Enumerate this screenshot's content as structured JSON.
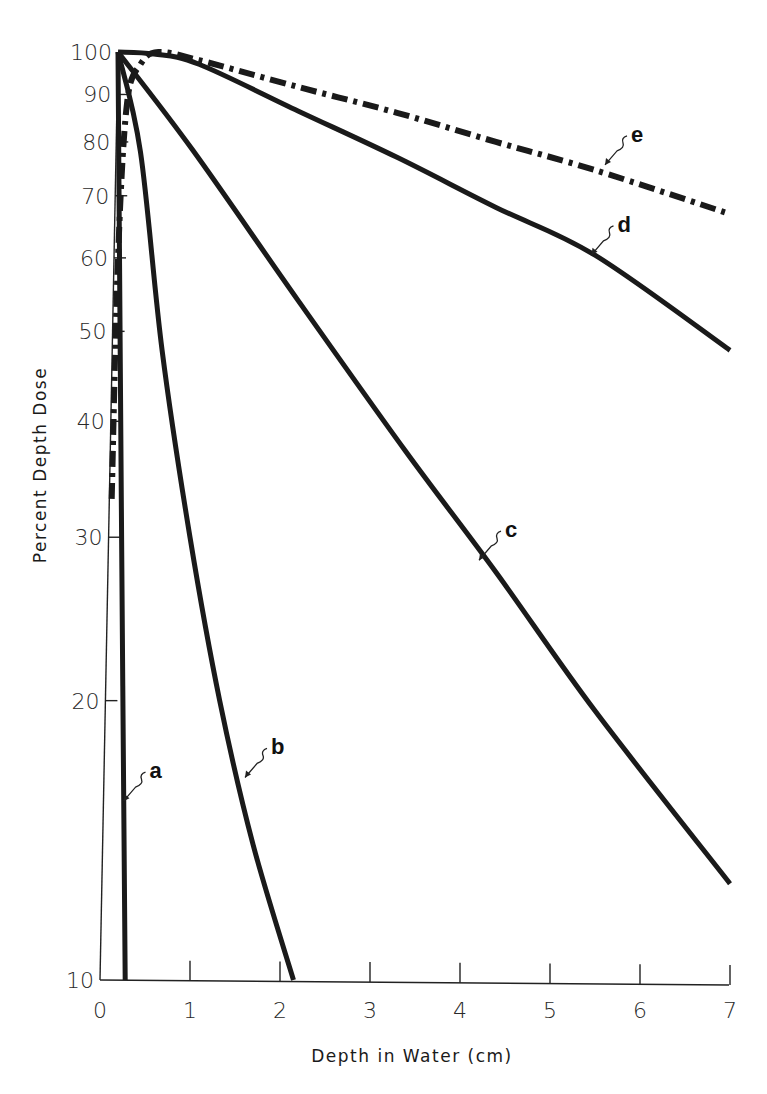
{
  "chart_data": {
    "type": "line",
    "title": "",
    "xlabel": "Depth in Water (cm)",
    "ylabel": "Percent Depth Dose",
    "xlim": [
      0,
      7
    ],
    "ylim": [
      10,
      100
    ],
    "yscale": "log",
    "grid": false,
    "legend": "none (curves labeled inline a–e)",
    "x_ticks": [
      "0",
      "1",
      "2",
      "3",
      "4",
      "5",
      "6",
      "7"
    ],
    "y_ticks": [
      "10",
      "20",
      "30",
      "40",
      "50",
      "60",
      "70",
      "80",
      "90",
      "100"
    ],
    "series": [
      {
        "name": "a",
        "style": "solid",
        "x": [
          0.2,
          0.24,
          0.28
        ],
        "values": [
          100,
          30,
          10
        ]
      },
      {
        "name": "b",
        "style": "solid",
        "x": [
          0.2,
          0.45,
          0.69,
          1.0,
          1.33,
          1.7,
          2.15
        ],
        "values": [
          100,
          78,
          47.7,
          30,
          20,
          14,
          10
        ]
      },
      {
        "name": "c",
        "style": "solid",
        "x": [
          0.2,
          1.03,
          2.2,
          3.39,
          4.4,
          5.5,
          7.0
        ],
        "values": [
          100,
          78.4,
          54,
          37.2,
          27.5,
          19.5,
          12.7
        ]
      },
      {
        "name": "d",
        "style": "solid",
        "x": [
          0.2,
          0.6,
          1.1,
          2.2,
          3.3,
          4.4,
          5.5,
          7.0
        ],
        "values": [
          100,
          99.5,
          97,
          86.4,
          77,
          68,
          60.4,
          47.7
        ]
      },
      {
        "name": "e",
        "style": "dash-dot",
        "x": [
          0.13,
          0.2,
          0.3,
          0.45,
          0.65,
          1.1,
          2.2,
          3.3,
          4.4,
          5.5,
          7.0
        ],
        "values": [
          33,
          60,
          88,
          97,
          100,
          98,
          91.7,
          86,
          80,
          74.6,
          66.9
        ]
      }
    ],
    "annotations": [
      {
        "text": "a",
        "x": 0.55,
        "y": 16.5
      },
      {
        "text": "b",
        "x": 1.9,
        "y": 17.5
      },
      {
        "text": "c",
        "x": 4.5,
        "y": 30
      },
      {
        "text": "d",
        "x": 5.75,
        "y": 64
      },
      {
        "text": "e",
        "x": 5.9,
        "y": 80
      }
    ]
  },
  "axes": {
    "x_title": "Depth in Water (cm)",
    "y_title": "Percent Depth Dose"
  }
}
